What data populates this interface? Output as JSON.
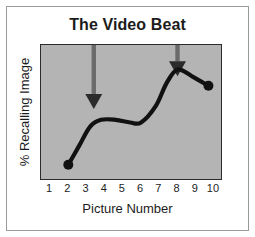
{
  "chart_data": {
    "type": "line",
    "title": "The Video Beat",
    "xlabel": "Picture Number",
    "ylabel": "% Recalling Image",
    "xlim": [
      0.5,
      10.5
    ],
    "ylim": [
      0,
      100
    ],
    "grid": false,
    "legend": null,
    "xticklabels": [
      "1",
      "2",
      "3",
      "4",
      "5",
      "6",
      "7",
      "8",
      "9",
      "10"
    ],
    "xticks": [
      1,
      2,
      3,
      4,
      5,
      6,
      7,
      8,
      9,
      10
    ],
    "yticklabels": [],
    "series": [
      {
        "name": "% Recalling Image",
        "marker": "filled-circle-endpoints",
        "color": "#111111",
        "x": [
          2,
          2.6,
          3.2,
          3.8,
          4.6,
          5.4,
          6.0,
          6.8,
          7.4,
          8.0,
          8.8,
          9.7
        ],
        "y": [
          12,
          26,
          40,
          45,
          45,
          43,
          43,
          55,
          72,
          82,
          77,
          70
        ]
      }
    ],
    "annotations": [
      {
        "type": "arrow",
        "label": "beat-arrow-left",
        "direction": "down",
        "x": 3.4,
        "y_from": 100,
        "y_to": 53,
        "color": "#6b6b6b"
      },
      {
        "type": "arrow",
        "label": "beat-arrow-right",
        "direction": "down",
        "x": 8.0,
        "y_from": 100,
        "y_to": 77,
        "color": "#6b6b6b"
      }
    ],
    "colors": {
      "plot_background": "#b4b4b4",
      "page_background": "#ffffff",
      "axis": "#2b2b2b",
      "line": "#111111",
      "arrow": "#6b6b6b",
      "text": "#1c1c1c",
      "frame": "#9a9a9a"
    }
  }
}
